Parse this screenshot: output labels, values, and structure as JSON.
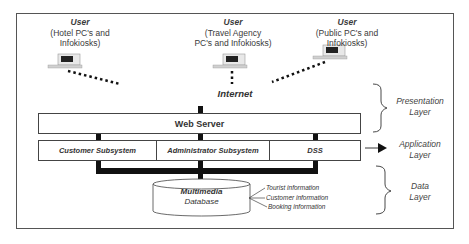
{
  "users": [
    {
      "title": "User",
      "line1": "(Hotel PC's and",
      "line2": "Infokiosks)"
    },
    {
      "title": "User",
      "line1": "(Travel Agency",
      "line2": "PC's and Infokiosks)"
    },
    {
      "title": "User",
      "line1": "(Public PC's and",
      "line2": "Infokiosks)"
    }
  ],
  "network": {
    "label": "Internet"
  },
  "web_server": {
    "label": "Web Server"
  },
  "subsystems": [
    {
      "label": "Customer Subsystem"
    },
    {
      "label": "Administrator Subsystem"
    },
    {
      "label": "DSS"
    }
  ],
  "database": {
    "line1": "Multimedia",
    "line2": "Database",
    "contents": [
      "Tourist information",
      "Customer information",
      "Booking information"
    ]
  },
  "layers": [
    {
      "line1": "Presentation",
      "line2": "Layer"
    },
    {
      "line1": "Application",
      "line2": "Layer"
    },
    {
      "line1": "Data",
      "line2": "Layer"
    }
  ]
}
